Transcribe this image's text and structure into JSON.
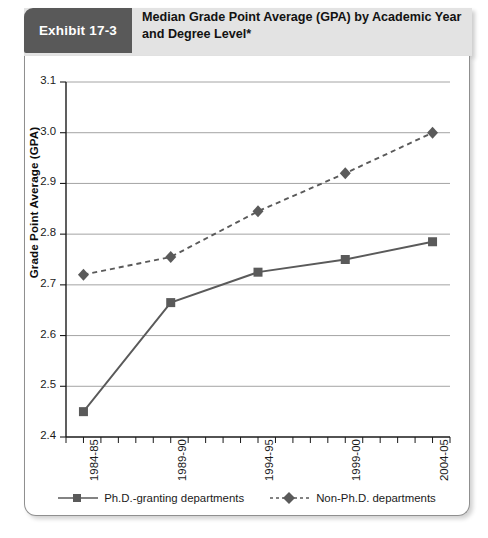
{
  "exhibit": {
    "badge_label": "Exhibit 17-3",
    "title": "Median Grade Point Average (GPA) by Academic Year and Degree Level*",
    "title_line1": "Median Grade Point Average (GPA) by Academic Year",
    "title_line2": "and Degree Level*",
    "badge_color": "#595959",
    "band_color": "#e3e3e3"
  },
  "chart_data": {
    "type": "line",
    "title": "Median Grade Point Average (GPA) by Academic Year and Degree Level*",
    "xlabel": "",
    "ylabel": "Grade Point Average (GPA)",
    "categories": [
      "1984-85",
      "1989-90",
      "1994-95",
      "1999-00",
      "2004-05"
    ],
    "ylim": [
      2.4,
      3.1
    ],
    "yticks": [
      "2.4",
      "2.5",
      "2.6",
      "2.7",
      "2.8",
      "2.9",
      "3.0",
      "3.1"
    ],
    "ytick_values": [
      2.4,
      2.5,
      2.6,
      2.7,
      2.8,
      2.9,
      3.0,
      3.1
    ],
    "grid": true,
    "legend_position": "bottom",
    "series": [
      {
        "name": "Ph.D.-granting departments",
        "values": [
          2.45,
          2.665,
          2.725,
          2.75,
          2.785
        ],
        "marker": "square",
        "linestyle": "solid",
        "color": "#5a5a5a"
      },
      {
        "name": "Non-Ph.D. departments",
        "values": [
          2.72,
          2.755,
          2.845,
          2.92,
          3.0
        ],
        "marker": "diamond",
        "linestyle": "dashed",
        "color": "#5a5a5a"
      }
    ],
    "minor_ticks_per_interval": 5
  },
  "legend": {
    "items": [
      {
        "label": "Ph.D.-granting departments",
        "marker": "square-marker-icon",
        "linestyle": "solid"
      },
      {
        "label": "Non-Ph.D. departments",
        "marker": "diamond-marker-icon",
        "linestyle": "dashed"
      }
    ]
  }
}
